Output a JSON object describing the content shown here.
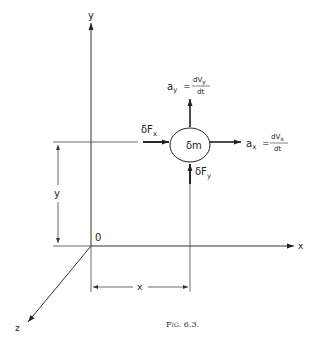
{
  "figure": {
    "caption": "Fig. 6.3.",
    "axes": {
      "y_label": "y",
      "x_label": "x",
      "z_label": "z",
      "origin_label": "0"
    },
    "dimensions": {
      "horizontal_label": "x",
      "vertical_label": "y"
    },
    "mass_element": {
      "label": "δm"
    },
    "forces": {
      "fx_label": "δF",
      "fx_sub": "x",
      "fy_label": "δF",
      "fy_sub": "y"
    },
    "accelerations": {
      "ax": {
        "lhs": "a",
        "lhs_sub": "x",
        "num": "dV",
        "num_sub": "x",
        "den": "dt"
      },
      "ay": {
        "lhs": "a",
        "lhs_sub": "y",
        "num": "dV",
        "num_sub": "y",
        "den": "dt"
      }
    },
    "colors": {
      "ink": "#222222",
      "background": "#ffffff"
    }
  }
}
